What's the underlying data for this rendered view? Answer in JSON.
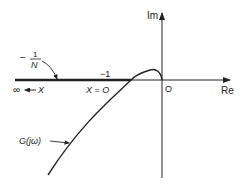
{
  "diagram": {
    "axes": {
      "imaginary_label": "Im",
      "real_label": "Re",
      "origin_label": "O"
    },
    "describing_function": {
      "label_top": "−1",
      "label_bottom": "N",
      "label_minus": "−",
      "minus_one_label": "−1",
      "x_zero_label": "X = O",
      "infinity_label": "∞ ← X"
    },
    "frequency_response": {
      "label": "G(jω)"
    },
    "colors": {
      "ink": "#222222",
      "background": "#ffffff"
    }
  }
}
